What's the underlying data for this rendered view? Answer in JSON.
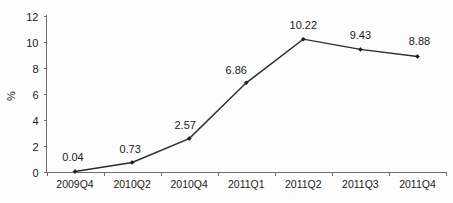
{
  "chart_data": {
    "type": "line",
    "title": "",
    "xlabel": "",
    "ylabel": "%",
    "categories": [
      "2009Q4",
      "2010Q2",
      "2010Q4",
      "2011Q1",
      "2011Q2",
      "2011Q3",
      "2011Q4"
    ],
    "values": [
      0.04,
      0.73,
      2.57,
      6.86,
      10.22,
      9.43,
      8.88
    ],
    "point_labels": [
      "0.04",
      "0.73",
      "2.57",
      "6.86",
      "10.22",
      "9.43",
      "8.88"
    ],
    "ylim": [
      0,
      12
    ],
    "ytick_labels": [
      "0",
      "2",
      "4",
      "6",
      "8",
      "10",
      "12"
    ],
    "ytick_values": [
      0,
      2,
      4,
      6,
      8,
      10,
      12
    ],
    "grid": false,
    "legend": "none",
    "series": [
      {
        "name": "",
        "values": [
          0.04,
          0.73,
          2.57,
          6.86,
          10.22,
          9.43,
          8.88
        ],
        "color": "#2b2b2b",
        "marker": "diamond"
      }
    ]
  },
  "axes": {
    "y_title": "%",
    "line_color": "#6e6e6e"
  }
}
